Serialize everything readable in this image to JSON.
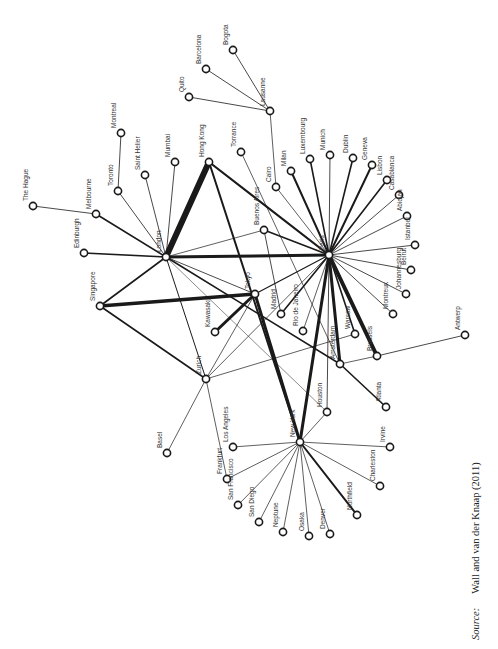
{
  "figure": {
    "type": "network-diagram",
    "source_label": "Source:",
    "source_text": "Wall and van der Knaap (2011)"
  },
  "nodes": [
    {
      "id": "the-hague",
      "label": "The Hague",
      "x": 33,
      "y": 206
    },
    {
      "id": "melbourne",
      "label": "Melbourne",
      "x": 96,
      "y": 214
    },
    {
      "id": "toronto",
      "label": "Toronto",
      "x": 118,
      "y": 191
    },
    {
      "id": "montreal",
      "label": "Montreal",
      "x": 121,
      "y": 133
    },
    {
      "id": "saint-helier",
      "label": "Saint Helier",
      "x": 145,
      "y": 175
    },
    {
      "id": "mumbai",
      "label": "Mumbai",
      "x": 175,
      "y": 162
    },
    {
      "id": "hong-kong",
      "label": "Hong Kong",
      "x": 209,
      "y": 162
    },
    {
      "id": "torrance",
      "label": "Torrance",
      "x": 241,
      "y": 152
    },
    {
      "id": "quito",
      "label": "Quito",
      "x": 189,
      "y": 97
    },
    {
      "id": "barcelona",
      "label": "Barcelona",
      "x": 206,
      "y": 69
    },
    {
      "id": "bogota",
      "label": "Bogota",
      "x": 233,
      "y": 50
    },
    {
      "id": "lausanne",
      "label": "Lausanne",
      "x": 270,
      "y": 111
    },
    {
      "id": "cairo",
      "label": "Cairo",
      "x": 276,
      "y": 187
    },
    {
      "id": "milan",
      "label": "Milan",
      "x": 291,
      "y": 171
    },
    {
      "id": "luxembourg",
      "label": "Luxembourg",
      "x": 310,
      "y": 159
    },
    {
      "id": "munich",
      "label": "Munich",
      "x": 330,
      "y": 155
    },
    {
      "id": "dublin",
      "label": "Dublin",
      "x": 353,
      "y": 158
    },
    {
      "id": "geneva",
      "label": "Geneva",
      "x": 372,
      "y": 165
    },
    {
      "id": "lisbon",
      "label": "Lisbon",
      "x": 387,
      "y": 180
    },
    {
      "id": "casablanca",
      "label": "Casablanca",
      "x": 399,
      "y": 195
    },
    {
      "id": "abidjan",
      "label": "Abidjan",
      "x": 407,
      "y": 216
    },
    {
      "id": "istanbul",
      "label": "Istanbul",
      "x": 415,
      "y": 245
    },
    {
      "id": "beirut",
      "label": "Beirut",
      "x": 411,
      "y": 270
    },
    {
      "id": "johannesburg",
      "label": "Johannesburg",
      "x": 406,
      "y": 294
    },
    {
      "id": "montreux",
      "label": "Montreux",
      "x": 393,
      "y": 314
    },
    {
      "id": "antwerp",
      "label": "Antwerp",
      "x": 465,
      "y": 335
    },
    {
      "id": "paris",
      "label": "Paris",
      "x": 329,
      "y": 255
    },
    {
      "id": "london",
      "label": "London",
      "x": 166,
      "y": 257
    },
    {
      "id": "edinburgh",
      "label": "Edinburgh",
      "x": 84,
      "y": 253
    },
    {
      "id": "singapore",
      "label": "Singapore",
      "x": 100,
      "y": 306
    },
    {
      "id": "tokyo",
      "label": "Tokyo",
      "x": 255,
      "y": 294
    },
    {
      "id": "kawasaki",
      "label": "Kawasaki",
      "x": 215,
      "y": 332
    },
    {
      "id": "zurich",
      "label": "Zurich",
      "x": 206,
      "y": 379
    },
    {
      "id": "buenos-aires",
      "label": "Buenos Aires",
      "x": 264,
      "y": 230
    },
    {
      "id": "madrid",
      "label": "Madrid",
      "x": 281,
      "y": 314
    },
    {
      "id": "rio-de-janeiro",
      "label": "Rio de Janeiro",
      "x": 303,
      "y": 331
    },
    {
      "id": "warsaw",
      "label": "Warsaw",
      "x": 355,
      "y": 334
    },
    {
      "id": "brussels",
      "label": "Brussels",
      "x": 377,
      "y": 356
    },
    {
      "id": "amsterdam",
      "label": "Amsterdam",
      "x": 340,
      "y": 364
    },
    {
      "id": "atlanta",
      "label": "Atlanta",
      "x": 386,
      "y": 407
    },
    {
      "id": "houston",
      "label": "Houston",
      "x": 327,
      "y": 412
    },
    {
      "id": "new-york",
      "label": "New York",
      "x": 300,
      "y": 442
    },
    {
      "id": "los-angeles",
      "label": "Los Angeles",
      "x": 233,
      "y": 447
    },
    {
      "id": "irvine",
      "label": "Irvine",
      "x": 390,
      "y": 447
    },
    {
      "id": "basel",
      "label": "Basel",
      "x": 167,
      "y": 453
    },
    {
      "id": "frankfurt",
      "label": "Frankfurt",
      "x": 227,
      "y": 479
    },
    {
      "id": "charleston",
      "label": "Charleston",
      "x": 380,
      "y": 486
    },
    {
      "id": "san-francisco",
      "label": "San Francisco",
      "x": 238,
      "y": 505
    },
    {
      "id": "san-diego",
      "label": "San Diego",
      "x": 259,
      "y": 522
    },
    {
      "id": "neptune",
      "label": "Neptune",
      "x": 283,
      "y": 532
    },
    {
      "id": "osaka",
      "label": "Osaka",
      "x": 309,
      "y": 536
    },
    {
      "id": "denver",
      "label": "Denver",
      "x": 330,
      "y": 534
    },
    {
      "id": "northfield",
      "label": "Northfield",
      "x": 357,
      "y": 515
    }
  ],
  "edges": [
    [
      "london",
      "hong-kong",
      6
    ],
    [
      "hong-kong",
      "paris",
      2.2
    ],
    [
      "hong-kong",
      "new-york",
      2
    ],
    [
      "london",
      "paris",
      3
    ],
    [
      "london",
      "edinburgh",
      1.6
    ],
    [
      "london",
      "melbourne",
      1.6
    ],
    [
      "london",
      "toronto",
      0.8
    ],
    [
      "london",
      "saint-helier",
      0.8
    ],
    [
      "london",
      "mumbai",
      0.8
    ],
    [
      "london",
      "singapore",
      1.6
    ],
    [
      "london",
      "zurich",
      1
    ],
    [
      "london",
      "buenos-aires",
      0.7
    ],
    [
      "london",
      "tokyo",
      0.8
    ],
    [
      "london",
      "amsterdam",
      1.6
    ],
    [
      "london",
      "houston",
      0.5
    ],
    [
      "melbourne",
      "the-hague",
      0.8
    ],
    [
      "toronto",
      "montreal",
      0.8
    ],
    [
      "singapore",
      "tokyo",
      3.5
    ],
    [
      "singapore",
      "zurich",
      1.6
    ],
    [
      "tokyo",
      "kawasaki",
      3
    ],
    [
      "tokyo",
      "paris",
      1.2
    ],
    [
      "tokyo",
      "new-york",
      3
    ],
    [
      "tokyo",
      "zurich",
      0.7
    ],
    [
      "torrance",
      "amsterdam",
      0.7
    ],
    [
      "lausanne",
      "quito",
      0.8
    ],
    [
      "lausanne",
      "barcelona",
      0.8
    ],
    [
      "lausanne",
      "bogota",
      0.8
    ],
    [
      "lausanne",
      "cairo",
      0.7
    ],
    [
      "paris",
      "cairo",
      0.7
    ],
    [
      "paris",
      "milan",
      2
    ],
    [
      "paris",
      "luxembourg",
      1.6
    ],
    [
      "paris",
      "munich",
      0.8
    ],
    [
      "paris",
      "dublin",
      1.6
    ],
    [
      "paris",
      "geneva",
      2
    ],
    [
      "paris",
      "lisbon",
      1.6
    ],
    [
      "paris",
      "casablanca",
      0.8
    ],
    [
      "paris",
      "abidjan",
      0.8
    ],
    [
      "paris",
      "istanbul",
      0.8
    ],
    [
      "paris",
      "beirut",
      0.8
    ],
    [
      "paris",
      "johannesburg",
      0.8
    ],
    [
      "paris",
      "montreux",
      0.8
    ],
    [
      "paris",
      "buenos-aires",
      1.6
    ],
    [
      "paris",
      "madrid",
      1.6
    ],
    [
      "paris",
      "rio-de-janeiro",
      0.7
    ],
    [
      "paris",
      "warsaw",
      1.6
    ],
    [
      "paris",
      "brussels",
      4
    ],
    [
      "paris",
      "amsterdam",
      3
    ],
    [
      "paris",
      "new-york",
      3
    ],
    [
      "paris",
      "houston",
      0.8
    ],
    [
      "paris",
      "zurich",
      0.7
    ],
    [
      "buenos-aires",
      "madrid",
      0.8
    ],
    [
      "brussels",
      "antwerp",
      0.8
    ],
    [
      "brussels",
      "amsterdam",
      0.7
    ],
    [
      "zurich",
      "warsaw",
      0.7
    ],
    [
      "zurich",
      "basel",
      0.7
    ],
    [
      "zurich",
      "frankfurt",
      0.7
    ],
    [
      "amsterdam",
      "atlanta",
      1.6
    ],
    [
      "new-york",
      "houston",
      0.7
    ],
    [
      "new-york",
      "los-angeles",
      0.7
    ],
    [
      "new-york",
      "irvine",
      0.7
    ],
    [
      "new-york",
      "frankfurt",
      0.7
    ],
    [
      "new-york",
      "charleston",
      0.7
    ],
    [
      "new-york",
      "san-francisco",
      0.7
    ],
    [
      "new-york",
      "san-diego",
      0.7
    ],
    [
      "new-york",
      "neptune",
      0.7
    ],
    [
      "new-york",
      "osaka",
      0.7
    ],
    [
      "new-york",
      "denver",
      0.7
    ],
    [
      "new-york",
      "northfield",
      2
    ]
  ]
}
